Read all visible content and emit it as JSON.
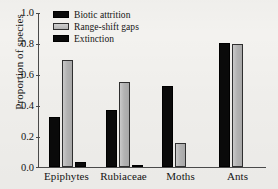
{
  "chart_data": {
    "type": "bar",
    "title": "",
    "subtitle": "",
    "xlabel": "",
    "ylabel": "Proportion of species",
    "categories": [
      "Epiphytes",
      "Rubiaceae",
      "Moths",
      "Ants"
    ],
    "series": [
      {
        "name": "Biotic attrition",
        "color": "#0a0a0a",
        "values": [
          0.32,
          0.37,
          0.52,
          0.8
        ]
      },
      {
        "name": "Range-shift gaps",
        "color": "#b4b4b4",
        "values": [
          0.69,
          0.55,
          0.155,
          0.795
        ]
      },
      {
        "name": "Extinction",
        "color": "#0a0a0a",
        "values": [
          0.03,
          0.015,
          0.0,
          0.0
        ]
      }
    ],
    "ylim": [
      0.0,
      1.0
    ],
    "ytick_labels": [
      "1.0",
      "0.8",
      "0.6",
      "0.4",
      "0.2",
      "0.0"
    ],
    "ytick_values": [
      1.0,
      0.8,
      0.6,
      0.4,
      0.2,
      0.0
    ],
    "grid": false,
    "legend_position": "top-left",
    "annotations": []
  },
  "legend": {
    "entries": [
      {
        "label": "Biotic attrition",
        "swatch": "black"
      },
      {
        "label": "Range-shift gaps",
        "swatch": "gray"
      },
      {
        "label": "Extinction",
        "swatch": "black"
      }
    ]
  }
}
